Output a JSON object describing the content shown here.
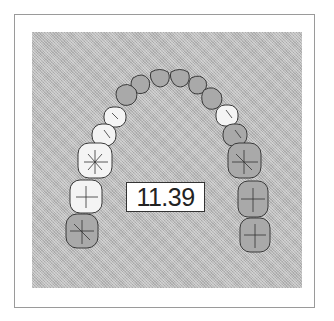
{
  "figure": {
    "title": "",
    "value_label": "11.39"
  },
  "arch": {
    "type": "maxillary dental arch, occlusal view",
    "teeth_total": 14,
    "colors": {
      "background": "#b9b9b9",
      "highlighted_tooth": "#f4f4f4",
      "normal_tooth": "#a9a9a9",
      "outline": "#3a3a3a"
    },
    "teeth": [
      {
        "id": "right-second-molar",
        "highlighted": false
      },
      {
        "id": "right-first-molar",
        "highlighted": true
      },
      {
        "id": "right-second-premolar",
        "highlighted": true
      },
      {
        "id": "right-first-premolar",
        "highlighted": true
      },
      {
        "id": "right-canine",
        "highlighted": true
      },
      {
        "id": "right-lateral-incisor",
        "highlighted": false
      },
      {
        "id": "right-central-incisor-a",
        "highlighted": false
      },
      {
        "id": "right-central-incisor-b",
        "highlighted": false
      },
      {
        "id": "left-central-incisor",
        "highlighted": false
      },
      {
        "id": "left-lateral-incisor",
        "highlighted": false
      },
      {
        "id": "left-canine",
        "highlighted": false
      },
      {
        "id": "left-first-premolar",
        "highlighted": true
      },
      {
        "id": "left-second-premolar",
        "highlighted": false
      },
      {
        "id": "left-first-molar",
        "highlighted": false
      },
      {
        "id": "left-second-molar",
        "highlighted": false
      },
      {
        "id": "left-third-molar",
        "highlighted": false
      }
    ]
  }
}
